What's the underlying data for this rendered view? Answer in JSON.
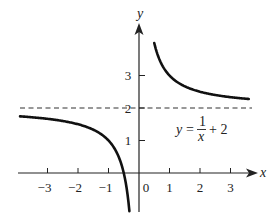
{
  "chart_data": {
    "type": "line",
    "title": "",
    "function": "y = 1/x + 2",
    "annotation": {
      "lhs": "y",
      "equals": "=",
      "numerator": "1",
      "denominator": "x",
      "rest": "+ 2"
    },
    "xlabel": "x",
    "ylabel": "y",
    "xlim": [
      -3.9,
      3.7
    ],
    "ylim": [
      -1.2,
      4.5
    ],
    "x_ticks": [
      -3,
      -2,
      -1,
      1,
      2,
      3
    ],
    "x_tick_labels": [
      "−3",
      "−2",
      "−1",
      "1",
      "2",
      "3"
    ],
    "origin_label": "0",
    "y_ticks": [
      1,
      2,
      3
    ],
    "y_tick_labels": [
      "1",
      "2",
      "3"
    ],
    "asymptotes": [
      {
        "type": "horizontal",
        "y": 2,
        "style": "dashed"
      },
      {
        "type": "vertical",
        "x": 0,
        "style": "coincides with y-axis"
      }
    ],
    "series": [
      {
        "name": "left branch (x<0)",
        "x": [
          -3.9,
          -3,
          -2,
          -1,
          -0.8,
          -0.6,
          -0.5,
          -0.4,
          -0.35,
          -0.31
        ],
        "y": [
          1.74,
          1.67,
          1.5,
          1.0,
          0.75,
          0.33,
          0.0,
          -0.5,
          -0.86,
          -1.23
        ]
      },
      {
        "name": "right branch (x>0)",
        "x": [
          0.5,
          0.6,
          0.8,
          1,
          1.5,
          2,
          2.5,
          3,
          3.6
        ],
        "y": [
          4.0,
          3.67,
          3.25,
          3.0,
          2.67,
          2.5,
          2.4,
          2.33,
          2.28
        ]
      }
    ],
    "grid": false,
    "legend": null
  }
}
